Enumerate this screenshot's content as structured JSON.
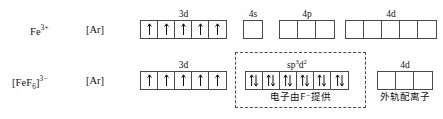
{
  "figure": {
    "type": "orbital-box-diagram"
  },
  "rows": [
    {
      "id": "fe3plus",
      "species_label": "Fe",
      "species_charge": "3+",
      "core_label": "[Ar]",
      "groups": [
        {
          "name": "3d",
          "label": "3d",
          "boxes": 5,
          "occupancy": [
            "up",
            "up",
            "up",
            "up",
            "up"
          ]
        },
        {
          "name": "4s",
          "label": "4s",
          "boxes": 1,
          "occupancy": [
            "empty"
          ]
        },
        {
          "name": "4p",
          "label": "4p",
          "boxes": 3,
          "occupancy": [
            "empty",
            "empty",
            "empty"
          ]
        },
        {
          "name": "4d",
          "label": "4d",
          "boxes": 5,
          "occupancy": [
            "empty",
            "empty",
            "empty",
            "empty",
            "empty"
          ]
        }
      ]
    },
    {
      "id": "fef6",
      "species_label_pre": "[FeF",
      "species_sub": "6",
      "species_label_post": "]",
      "species_charge": "3−",
      "core_label": "[Ar]",
      "groups": [
        {
          "name": "3d",
          "label": "3d",
          "boxes": 5,
          "occupancy": [
            "up",
            "up",
            "up",
            "up",
            "up"
          ]
        },
        {
          "name": "sp3d2",
          "label_base_1": "sp",
          "label_sup_1": "3",
          "label_base_2": "d",
          "label_sup_2": "2",
          "boxes": 6,
          "occupancy": [
            "pair",
            "pair",
            "pair",
            "pair",
            "pair",
            "pair"
          ],
          "caption": "电子由F⁻提供"
        },
        {
          "name": "4d",
          "label": "4d",
          "boxes": 3,
          "occupancy": [
            "empty",
            "empty",
            "empty"
          ],
          "caption": "外轨配离子"
        }
      ]
    }
  ],
  "colors": {
    "stroke": "#4a4a4a",
    "text": "#111111",
    "background": "#ffffff"
  }
}
